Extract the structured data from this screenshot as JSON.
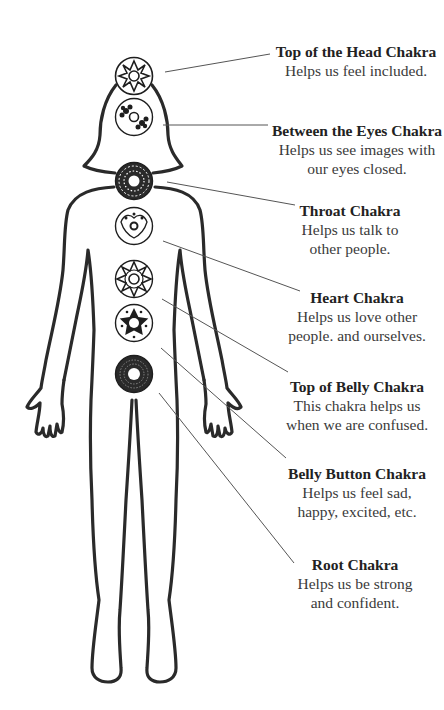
{
  "diagram": {
    "line_color": "#2a2a2a",
    "leader_color": "#555555",
    "chakras": [
      {
        "id": "crown",
        "title": "Top of the Head Chakra",
        "desc_lines": [
          "Helps us feel included."
        ],
        "symbol": "eight-point-star",
        "center": [
          134,
          76
        ]
      },
      {
        "id": "third-eye",
        "title": "Between the Eyes Chakra",
        "desc_lines": [
          "Helps us see images with",
          "our eyes closed."
        ],
        "symbol": "twin-flower",
        "center": [
          134,
          117
        ]
      },
      {
        "id": "throat",
        "title": "Throat Chakra",
        "desc_lines": [
          "Helps us talk to",
          "other people."
        ],
        "symbol": "dense-mandala",
        "center": [
          134,
          181
        ]
      },
      {
        "id": "heart",
        "title": "Heart Chakra",
        "desc_lines": [
          "Helps us love other",
          "people. and ourselves."
        ],
        "symbol": "lotus-ring",
        "center": [
          134,
          226
        ]
      },
      {
        "id": "solar-plexus",
        "title": "Top of Belly Chakra",
        "desc_lines": [
          "This chakra helps us",
          "when we are confused."
        ],
        "symbol": "star-burst",
        "center": [
          134,
          279
        ]
      },
      {
        "id": "sacral",
        "title": "Belly Button Chakra",
        "desc_lines": [
          "Helps us feel sad,",
          "happy, excited, etc."
        ],
        "symbol": "pentagram",
        "center": [
          134,
          323
        ]
      },
      {
        "id": "root",
        "title": "Root Chakra",
        "desc_lines": [
          "Helps us be strong",
          "and confident."
        ],
        "symbol": "dark-ring",
        "center": [
          134,
          374
        ]
      }
    ]
  }
}
